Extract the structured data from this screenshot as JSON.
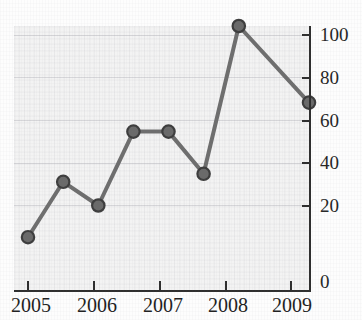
{
  "title": {
    "text": "",
    "note": "cropped-off at top edge"
  },
  "chart_data": {
    "type": "line",
    "title": "",
    "xlabel": "",
    "ylabel": "",
    "x": [
      2005,
      2005.5,
      2006,
      2006.5,
      2007,
      2007.5,
      2008,
      2009
    ],
    "values": [
      20,
      41,
      32,
      60,
      60,
      44,
      100,
      71
    ],
    "xlim": [
      2004.8,
      2009.0
    ],
    "ylim": [
      0,
      100
    ],
    "xticks": [
      2005,
      2006,
      2007,
      2008,
      2009
    ],
    "xtick_labels": [
      "2005",
      "2006",
      "2007",
      "2008",
      "2009"
    ],
    "yticks": [
      0,
      20,
      40,
      60,
      80,
      100
    ],
    "ytick_labels": [
      "0",
      "20",
      "40",
      "60",
      "80",
      "100"
    ],
    "y_axis_position": "right",
    "grid": true,
    "legend": false,
    "marker": "circle",
    "line_color": "#6e6e6e",
    "marker_color": "#6a6a6a",
    "marker_edge_color": "#3d3d3d",
    "plot_background": "#f3f3f3",
    "axis_color": "#2e2e2e"
  },
  "axes": {
    "y_labels": [
      "100",
      "80",
      "60",
      "40",
      "20",
      "0"
    ],
    "x_labels": [
      "2005",
      "2006",
      "2007",
      "2008",
      "2009"
    ]
  }
}
